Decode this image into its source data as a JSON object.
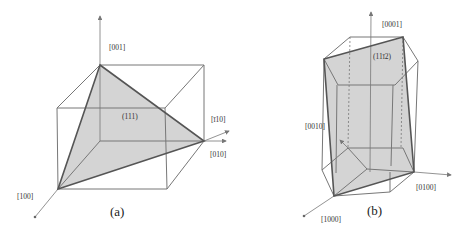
{
  "figure_a": {
    "caption": "(a)",
    "plane_label": "(111)",
    "axis_labels": {
      "z": "[001]",
      "y": "[010]",
      "x": "[100]",
      "diag": "[ī10]"
    },
    "colors": {
      "plane_fill": "#d4d4d4",
      "edges": "#777777"
    }
  },
  "figure_b": {
    "caption": "(b)",
    "plane_label": "(11ī2)",
    "axis_labels": {
      "c": "[0001]",
      "a1": "[1000]",
      "a2": "[0100]",
      "a3": "[0010]"
    },
    "colors": {
      "plane_fill": "#d4d4d4",
      "edges": "#777777"
    }
  }
}
